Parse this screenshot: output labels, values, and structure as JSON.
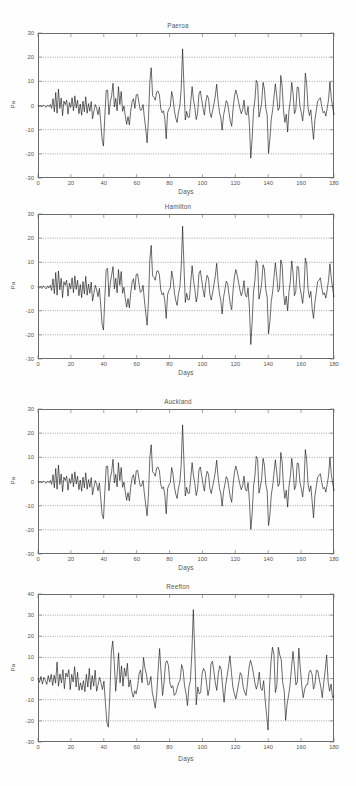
{
  "figure": {
    "background": "#ffffff",
    "line_color": "#111111",
    "axis_color": "#6b6b6b",
    "grid_color": "#5a5a5a"
  },
  "panels": [
    {
      "title": "Paeroa",
      "xlabel": "Days",
      "ylabel": "Pa",
      "yticks": [
        "30",
        "20",
        "10",
        "0",
        "-10",
        "-20",
        "-30"
      ],
      "xticks": [
        "0",
        "20",
        "40",
        "60",
        "80",
        "100",
        "120",
        "140",
        "160",
        "180"
      ]
    },
    {
      "title": "Hamilton",
      "xlabel": "Days",
      "ylabel": "Pa",
      "yticks": [
        "30",
        "20",
        "10",
        "0",
        "-10",
        "-20",
        "-30"
      ],
      "xticks": [
        "0",
        "20",
        "40",
        "60",
        "80",
        "100",
        "120",
        "140",
        "160",
        "180"
      ]
    },
    {
      "title": "Auckland",
      "xlabel": "Days",
      "ylabel": "Pa",
      "yticks": [
        "30",
        "20",
        "10",
        "0",
        "-10",
        "-20",
        "-30"
      ],
      "xticks": [
        "0",
        "20",
        "40",
        "60",
        "80",
        "100",
        "120",
        "140",
        "160",
        "180"
      ]
    },
    {
      "title": "Reefton",
      "xlabel": "Days",
      "ylabel": "Pa",
      "yticks": [
        "40",
        "30",
        "20",
        "10",
        "0",
        "-10",
        "-20",
        "-30"
      ],
      "xticks": [
        "0",
        "20",
        "40",
        "60",
        "80",
        "100",
        "120",
        "140",
        "160",
        "180"
      ]
    }
  ],
  "chart_data": [
    {
      "type": "line",
      "title": "Paeroa",
      "xlabel": "Days",
      "ylabel": "Pa",
      "xlim": [
        0,
        180
      ],
      "ylim": [
        -30,
        30
      ],
      "xticks": [
        0,
        20,
        40,
        60,
        80,
        100,
        120,
        140,
        160,
        180
      ],
      "yticks": [
        -30,
        -20,
        -10,
        0,
        10,
        20,
        30
      ],
      "grid": true,
      "grid_style": "dotted horizontal",
      "legend": "none",
      "series": [
        {
          "name": "Paeroa pressure residual",
          "x_step": 1,
          "values": [
            0,
            -0.4,
            -0.2,
            -0.6,
            0.2,
            -0.3,
            -0.8,
            0.1,
            -0.5,
            0.4,
            -1.2,
            2.8,
            -2.6,
            5.4,
            -3.2,
            6.8,
            -1.2,
            3.1,
            -4.2,
            1.8,
            0.4,
            2.2,
            -3.6,
            1.2,
            -0.8,
            3.2,
            -2.2,
            4.0,
            -1.0,
            2.2,
            -3.4,
            0.6,
            -4.0,
            1.8,
            -2.6,
            3.6,
            -3.2,
            0.8,
            -2.4,
            1.6,
            -5.5,
            -2.2,
            0.4,
            -1.2,
            -3.8,
            -0.6,
            -7.0,
            -14.0,
            -16.8,
            -4.2,
            6.2,
            6.4,
            -3.8,
            1.2,
            4.2,
            9.2,
            -0.6,
            3.0,
            -2.2,
            7.8,
            0.4,
            5.8,
            -2.4,
            -0.2,
            -4.4,
            -7.8,
            -4.6,
            -8.0,
            -2.2,
            1.6,
            2.8,
            -1.2,
            4.4,
            4.6,
            1.2,
            -2.0,
            -1.8,
            0.4,
            -5.0,
            -9.8,
            -15.4,
            -5.2,
            10.0,
            15.6,
            4.0,
            3.4,
            2.2,
            5.6,
            6.0,
            4.4,
            -1.2,
            -3.0,
            -2.2,
            -5.6,
            -13.8,
            -3.0,
            -1.4,
            -0.5,
            5.8,
            3.0,
            -2.2,
            -5.2,
            -7.0,
            -2.6,
            -0.2,
            7.2,
            23.4,
            8.0,
            -6.0,
            -2.4,
            -5.0,
            -4.8,
            1.6,
            7.8,
            2.2,
            -1.0,
            -5.8,
            -3.2,
            4.8,
            6.0,
            2.4,
            -1.2,
            -4.0,
            1.4,
            4.2,
            3.0,
            -2.8,
            -5.0,
            -2.2,
            0.6,
            4.0,
            8.8,
            2.0,
            -2.6,
            -5.0,
            -10.2,
            -4.2,
            -1.2,
            2.0,
            1.0,
            -2.8,
            -6.6,
            -8.6,
            -1.4,
            3.6,
            6.4,
            4.4,
            1.6,
            -1.2,
            -3.4,
            -1.8,
            2.2,
            -3.2,
            -4.0,
            -0.4,
            -8.0,
            -21.8,
            -13.4,
            -2.0,
            2.2,
            10.4,
            9.2,
            -4.8,
            -2.2,
            1.4,
            9.6,
            6.8,
            -1.2,
            -4.0,
            -19.8,
            -14.0,
            -5.6,
            -2.0,
            3.4,
            9.0,
            4.0,
            -2.0,
            -1.0,
            12.4,
            8.0,
            -2.2,
            -7.0,
            -3.6,
            -11.0,
            -2.0,
            2.0,
            9.6,
            5.0,
            -3.4,
            -1.8,
            7.6,
            7.4,
            -0.2,
            -2.8,
            -6.4,
            -1.2,
            13.4,
            8.4,
            -1.0,
            -4.2,
            -1.8,
            -8.4,
            -14.0,
            -6.0,
            -2.2,
            1.8,
            2.4,
            3.2,
            -0.4,
            -3.0,
            -2.4,
            -4.4,
            -1.2,
            2.4,
            9.8,
            3.2,
            -0.6,
            -3.8
          ]
        }
      ]
    },
    {
      "type": "line",
      "title": "Hamilton",
      "xlabel": "Days",
      "ylabel": "Pa",
      "xlim": [
        0,
        180
      ],
      "ylim": [
        -30,
        30
      ],
      "xticks": [
        0,
        20,
        40,
        60,
        80,
        100,
        120,
        140,
        160,
        180
      ],
      "yticks": [
        -30,
        -20,
        -10,
        0,
        10,
        20,
        30
      ],
      "grid": true,
      "grid_style": "dotted horizontal",
      "legend": "none",
      "series": [
        {
          "name": "Hamilton pressure residual",
          "x_step": 1,
          "values": [
            0,
            -0.6,
            -0.3,
            -0.8,
            0.3,
            -0.4,
            -1.0,
            0.2,
            -0.6,
            0.5,
            -1.6,
            3.2,
            -3.0,
            5.8,
            -3.6,
            6.4,
            -1.4,
            3.4,
            -4.6,
            2.0,
            0.5,
            2.6,
            -4.0,
            1.4,
            -1.0,
            3.6,
            -2.6,
            4.4,
            -1.2,
            2.6,
            -3.8,
            0.8,
            -4.6,
            2.0,
            -3.0,
            4.2,
            -3.6,
            1.0,
            -2.8,
            1.8,
            -6.0,
            -2.6,
            0.5,
            -1.4,
            -4.2,
            -0.8,
            -8.0,
            -15.6,
            -18.0,
            -4.6,
            7.0,
            7.6,
            -4.2,
            1.4,
            4.8,
            8.2,
            -1.0,
            3.4,
            -2.6,
            7.0,
            0.5,
            6.2,
            -2.8,
            -0.3,
            -5.0,
            -8.6,
            -5.0,
            -8.8,
            -2.6,
            1.8,
            3.2,
            -1.4,
            5.0,
            5.2,
            1.4,
            -2.4,
            -2.0,
            0.5,
            -5.6,
            -11.0,
            -16.0,
            -5.8,
            11.0,
            17.0,
            4.4,
            3.8,
            2.6,
            6.2,
            6.6,
            4.8,
            -1.4,
            -3.4,
            -2.6,
            -6.2,
            -13.2,
            -3.4,
            -1.6,
            -0.6,
            6.4,
            3.4,
            -2.6,
            -5.8,
            -7.8,
            -3.0,
            -0.3,
            8.0,
            25.0,
            8.8,
            -6.6,
            -2.8,
            -5.6,
            -5.4,
            1.8,
            8.6,
            2.6,
            -1.2,
            -6.4,
            -3.6,
            5.4,
            6.6,
            2.8,
            -1.4,
            -4.4,
            1.6,
            4.6,
            3.4,
            -3.2,
            -5.6,
            -2.6,
            0.8,
            4.4,
            9.6,
            2.2,
            -3.0,
            -5.6,
            -11.4,
            -4.6,
            -1.4,
            2.2,
            1.2,
            -3.2,
            -7.4,
            -9.6,
            -1.6,
            4.0,
            7.0,
            4.8,
            1.8,
            -1.4,
            -3.8,
            -2.0,
            2.4,
            -3.6,
            -4.4,
            -0.5,
            -9.0,
            -24.0,
            -14.6,
            -2.2,
            2.4,
            10.8,
            9.6,
            -5.2,
            -2.6,
            1.6,
            9.0,
            7.2,
            -1.4,
            -4.4,
            -19.6,
            -14.6,
            -6.2,
            -2.2,
            3.8,
            9.8,
            4.4,
            -2.2,
            -1.2,
            11.0,
            8.8,
            -2.6,
            -7.6,
            -4.0,
            -10.0,
            -2.2,
            2.2,
            10.6,
            5.4,
            -3.8,
            -2.0,
            8.4,
            8.0,
            -0.3,
            -3.2,
            -7.0,
            -1.4,
            11.8,
            9.2,
            -1.2,
            -4.6,
            -2.0,
            -9.2,
            -13.2,
            -6.6,
            -2.6,
            2.0,
            2.6,
            3.6,
            -0.5,
            -3.4,
            -2.6,
            -4.8,
            -1.4,
            2.6,
            9.4,
            3.6,
            -0.8,
            -4.2
          ]
        }
      ]
    },
    {
      "type": "line",
      "title": "Auckland",
      "xlabel": "Days",
      "ylabel": "Pa",
      "xlim": [
        0,
        180
      ],
      "ylim": [
        -30,
        30
      ],
      "xticks": [
        0,
        20,
        40,
        60,
        80,
        100,
        120,
        140,
        160,
        180
      ],
      "yticks": [
        -30,
        -20,
        -10,
        0,
        10,
        20,
        30
      ],
      "grid": true,
      "grid_style": "dotted horizontal",
      "legend": "none",
      "series": [
        {
          "name": "Auckland pressure residual",
          "x_step": 1,
          "values": [
            0,
            -0.4,
            -0.2,
            -0.6,
            0.2,
            -0.3,
            -0.8,
            0.1,
            -0.5,
            0.4,
            -1.2,
            2.8,
            -2.6,
            5.4,
            -3.2,
            6.8,
            -1.2,
            3.1,
            -4.2,
            1.8,
            0.4,
            2.2,
            -3.6,
            1.2,
            -0.8,
            3.2,
            -2.2,
            4.0,
            -1.0,
            2.2,
            -3.4,
            0.6,
            -4.0,
            1.8,
            -2.6,
            3.6,
            -3.2,
            0.8,
            -2.4,
            1.6,
            -5.5,
            -2.2,
            0.4,
            -1.2,
            -3.8,
            -0.6,
            -7.0,
            -13.6,
            -15.4,
            -4.2,
            6.2,
            6.4,
            -3.8,
            1.2,
            4.2,
            9.2,
            -0.6,
            3.0,
            -2.2,
            7.8,
            0.4,
            5.8,
            -2.4,
            -0.2,
            -4.4,
            -7.8,
            -4.6,
            -8.0,
            -2.2,
            1.6,
            2.8,
            -1.2,
            4.4,
            4.6,
            1.2,
            -2.0,
            -1.8,
            0.4,
            -5.0,
            -9.8,
            -14.2,
            -5.2,
            10.0,
            15.2,
            4.0,
            3.4,
            2.2,
            5.6,
            6.0,
            4.4,
            -1.2,
            -3.0,
            -2.2,
            -5.6,
            -13.4,
            -3.0,
            -1.4,
            -0.5,
            5.8,
            3.0,
            -2.2,
            -5.2,
            -7.0,
            -2.6,
            -0.2,
            7.2,
            23.4,
            8.0,
            -6.0,
            -2.4,
            -5.0,
            -4.8,
            1.6,
            7.8,
            2.2,
            -1.0,
            -5.8,
            -3.2,
            4.8,
            6.0,
            2.4,
            -1.2,
            -4.0,
            1.4,
            4.2,
            3.0,
            -2.8,
            -5.0,
            -2.2,
            0.6,
            4.0,
            8.8,
            2.0,
            -2.6,
            -5.0,
            -10.2,
            -4.2,
            -1.2,
            2.0,
            1.0,
            -2.8,
            -6.6,
            -8.6,
            -1.4,
            3.6,
            6.4,
            4.4,
            1.6,
            -1.2,
            -3.4,
            -1.8,
            2.2,
            -3.2,
            -4.0,
            -0.4,
            -8.0,
            -19.8,
            -13.4,
            -2.0,
            2.2,
            10.4,
            9.2,
            -4.8,
            -2.2,
            1.4,
            9.6,
            6.8,
            -1.2,
            -4.0,
            -18.2,
            -14.0,
            -5.6,
            -2.0,
            3.4,
            9.0,
            4.0,
            -2.0,
            -1.0,
            12.0,
            8.0,
            -2.2,
            -7.0,
            -3.6,
            -10.6,
            -2.0,
            2.0,
            9.6,
            5.0,
            -3.4,
            -1.8,
            7.6,
            7.4,
            -0.2,
            -2.8,
            -6.4,
            -1.2,
            13.2,
            8.4,
            -1.0,
            -4.2,
            -1.8,
            -8.4,
            -15.0,
            -6.0,
            -2.2,
            1.8,
            2.4,
            3.2,
            -0.4,
            -3.0,
            -2.4,
            -4.4,
            -1.2,
            2.4,
            10.0,
            3.2,
            -0.6,
            -3.8
          ]
        }
      ]
    },
    {
      "type": "line",
      "title": "Reefton",
      "xlabel": "Days",
      "ylabel": "Pa",
      "xlim": [
        0,
        180
      ],
      "ylim": [
        -30,
        40
      ],
      "xticks": [
        0,
        20,
        40,
        60,
        80,
        100,
        120,
        140,
        160,
        180
      ],
      "yticks": [
        -30,
        -20,
        -10,
        0,
        10,
        20,
        30,
        40
      ],
      "grid": true,
      "grid_style": "dotted horizontal",
      "legend": "none",
      "series": [
        {
          "name": "Reefton pressure residual",
          "x_step": 1,
          "values": [
            0,
            -1.8,
            1.0,
            -2.6,
            0.6,
            -1.0,
            -2.8,
            1.4,
            -1.6,
            2.0,
            -3.2,
            1.6,
            -2.2,
            7.8,
            -3.6,
            2.2,
            -2.0,
            4.2,
            -4.8,
            2.6,
            0.8,
            4.2,
            -5.2,
            2.0,
            -1.6,
            5.6,
            -4.0,
            3.0,
            -5.6,
            -2.0,
            -5.4,
            -1.0,
            -6.2,
            2.0,
            -4.0,
            4.8,
            -5.2,
            1.4,
            -3.6,
            4.0,
            -6.0,
            -3.0,
            0.6,
            -2.0,
            -5.2,
            -1.2,
            -11.6,
            -20.6,
            -23.0,
            -8.0,
            12.0,
            17.8,
            8.2,
            -6.0,
            2.0,
            12.2,
            -2.0,
            6.0,
            -3.6,
            5.0,
            1.0,
            7.2,
            -4.0,
            -0.6,
            -6.0,
            -8.8,
            -5.8,
            -7.2,
            -3.6,
            2.4,
            4.0,
            -2.0,
            10.0,
            4.8,
            2.0,
            -3.0,
            -2.6,
            1.0,
            -6.6,
            -10.0,
            -14.0,
            -7.4,
            4.0,
            14.2,
            2.6,
            -8.0,
            -2.0,
            7.2,
            8.4,
            6.2,
            -2.0,
            -4.4,
            -3.4,
            -8.0,
            -7.2,
            -4.4,
            -2.0,
            -0.8,
            6.6,
            4.2,
            -3.4,
            -7.0,
            -12.8,
            -4.0,
            -1.0,
            12.4,
            32.6,
            12.4,
            -12.4,
            -4.0,
            -7.2,
            -6.6,
            2.4,
            4.8,
            3.4,
            -2.0,
            -8.0,
            -4.6,
            6.8,
            8.2,
            3.6,
            -2.0,
            -5.6,
            2.0,
            6.0,
            4.4,
            -4.0,
            -11.2,
            -3.4,
            1.0,
            5.6,
            10.8,
            2.8,
            -4.0,
            -7.2,
            -9.6,
            -6.0,
            -2.0,
            2.8,
            1.6,
            -4.0,
            -6.4,
            -8.0,
            -2.0,
            5.0,
            8.6,
            6.2,
            2.4,
            -2.0,
            -5.0,
            -2.6,
            3.0,
            -4.6,
            -5.6,
            -1.0,
            -10.0,
            -17.0,
            -24.4,
            -4.0,
            8.0,
            14.8,
            11.6,
            -6.6,
            -3.4,
            14.8,
            11.2,
            8.8,
            -2.0,
            -5.6,
            -19.8,
            -12.0,
            -8.0,
            -3.0,
            5.0,
            12.8,
            5.6,
            -3.0,
            -1.6,
            14.4,
            5.0,
            -3.4,
            -9.0,
            -5.0,
            -3.0,
            -2.8,
            3.0,
            4.0,
            2.0,
            -5.0,
            -2.6,
            4.0,
            3.6,
            -0.6,
            -4.0,
            -9.0,
            -2.0,
            4.0,
            11.2,
            -1.6,
            -6.0,
            -2.6,
            -9.0,
            -8.4
          ]
        }
      ]
    }
  ]
}
